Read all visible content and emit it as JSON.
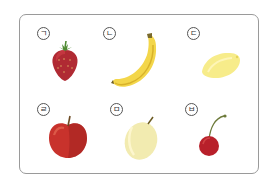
{
  "worksheet": {
    "items": [
      {
        "label": "ㄱ",
        "fruit": "strawberry",
        "color": "#b02a33"
      },
      {
        "label": "ㄴ",
        "fruit": "banana",
        "color": "#f3d64a"
      },
      {
        "label": "ㄷ",
        "fruit": "lemon",
        "color": "#f7ec8a"
      },
      {
        "label": "ㄹ",
        "fruit": "apple",
        "color": "#c8322c"
      },
      {
        "label": "ㅁ",
        "fruit": "plum",
        "color": "#f2ebb0"
      },
      {
        "label": "ㅂ",
        "fruit": "cherry",
        "color": "#b8202a"
      }
    ]
  }
}
